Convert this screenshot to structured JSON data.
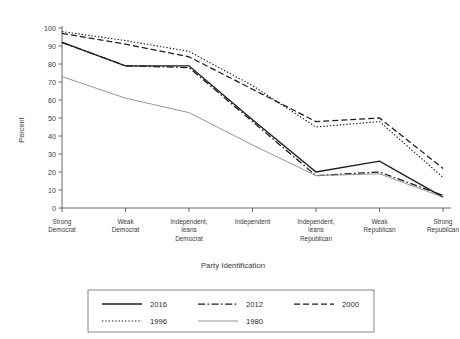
{
  "chart_data": {
    "type": "line",
    "title": "",
    "xlabel": "Party Identification",
    "ylabel": "Percent",
    "ylim": [
      0,
      100
    ],
    "ytick_labels": [
      "0",
      "10",
      "20",
      "30",
      "40",
      "50",
      "60",
      "70",
      "80",
      "90",
      "100"
    ],
    "ytick_values": [
      0,
      10,
      20,
      30,
      40,
      50,
      60,
      70,
      80,
      90,
      100
    ],
    "grid": false,
    "legend_position": "bottom",
    "categories": [
      "Strong\nDemocrat",
      "Weak\nDemocrat",
      "Independent,\nleans\nDemocrat",
      "Independent",
      "Independent,\nleans\nRepublican",
      "Weak\nRepublican",
      "Strong\nRepublican"
    ],
    "category_lines": [
      [
        "Strong",
        "Democrat"
      ],
      [
        "Weak",
        "Democrat"
      ],
      [
        "Independent,",
        "leans",
        "Democrat"
      ],
      [
        "Independent"
      ],
      [
        "Independent,",
        "leans",
        "Republican"
      ],
      [
        "Weak",
        "Republican"
      ],
      [
        "Strong",
        "Republican"
      ]
    ],
    "series": [
      {
        "name": "2016",
        "style": "solid",
        "color": "#1a1a1a",
        "width": 1.35,
        "dash": "none",
        "values": [
          92,
          79,
          79,
          49,
          20,
          26,
          6
        ]
      },
      {
        "name": "2012",
        "style": "dashdot",
        "color": "#1a1a1a",
        "width": 1.25,
        "dash": "7,2.5,1.6,2.5",
        "values": [
          92,
          79,
          78,
          48,
          18,
          20,
          7
        ]
      },
      {
        "name": "2000",
        "style": "dashed",
        "color": "#1a1a1a",
        "width": 1.25,
        "dash": "6,3",
        "values": [
          97,
          91,
          84,
          66,
          48,
          50,
          22
        ]
      },
      {
        "name": "1996",
        "style": "dotted",
        "color": "#1a1a1a",
        "width": 1.1,
        "dash": "1.4,1.9",
        "values": [
          98,
          93,
          87,
          68,
          45,
          48,
          17
        ]
      },
      {
        "name": "1980",
        "style": "solid",
        "color": "#8a8a8a",
        "width": 0.9,
        "dash": "none",
        "values": [
          73,
          61,
          53,
          35,
          18,
          19,
          6
        ]
      }
    ]
  },
  "legend": {
    "entries": [
      {
        "label": "2016"
      },
      {
        "label": "2012"
      },
      {
        "label": "2000"
      },
      {
        "label": "1996"
      },
      {
        "label": "1980"
      }
    ]
  }
}
